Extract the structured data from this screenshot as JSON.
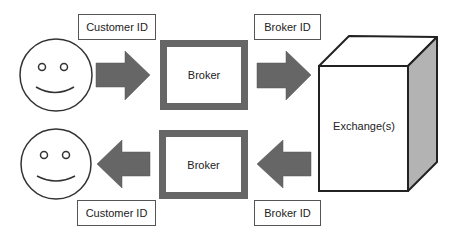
{
  "diagram": {
    "top_flow": {
      "customer_label": "Customer ID",
      "broker_label": "Broker",
      "broker_id_label": "Broker ID"
    },
    "bottom_flow": {
      "customer_label": "Customer ID",
      "broker_label": "Broker",
      "broker_id_label": "Broker ID"
    },
    "exchange_label": "Exchange(s)",
    "colors": {
      "arrow_fill": "#666666",
      "broker_border": "#666666",
      "cube_side": "#b3b3b3",
      "outline": "#222222"
    }
  }
}
